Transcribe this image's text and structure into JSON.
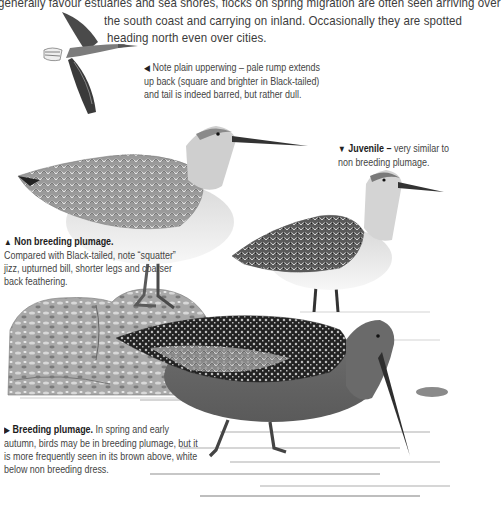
{
  "intro": {
    "line1": "generally favour estuaries and sea shores, flocks on spring migration are often seen arriving over",
    "line2": "the south coast and carrying on inland. Occasionally they are spotted",
    "line3": "heading north even over cities."
  },
  "captions": {
    "flight": {
      "icon": "arrow-left-icon",
      "text": "Note plain upperwing – pale rump extends up back (square and brighter in Black-tailed) and tail is indeed barred, but rather dull."
    },
    "juvenile": {
      "icon": "arrow-down-icon",
      "title": "Juvenile –",
      "text": " very similar to non breeding plumage."
    },
    "non_breeding": {
      "icon": "arrow-up-icon",
      "title": "Non breeding plumage.",
      "text": "Compared with Black-tailed, note “squatter” jizz, upturned bill, shorter legs and coarser back feathering."
    },
    "breeding": {
      "icon": "arrow-right-icon",
      "title": "Breeding plumage.",
      "text": " In spring and early autumn, birds may be in breeding plumage, but it is more frequently seen in its brown above, white below non breeding dress."
    }
  },
  "illustrations": [
    {
      "name": "flying-godwit",
      "subject": "Bar-tailed Godwit in flight"
    },
    {
      "name": "non-breeding-godwit",
      "subject": "Bar-tailed Godwit, non breeding plumage"
    },
    {
      "name": "juvenile-godwit",
      "subject": "Bar-tailed Godwit, juvenile"
    },
    {
      "name": "breeding-godwit",
      "subject": "Bar-tailed Godwit, breeding plumage, wading"
    },
    {
      "name": "rock",
      "subject": "Lichen-covered rock"
    }
  ]
}
